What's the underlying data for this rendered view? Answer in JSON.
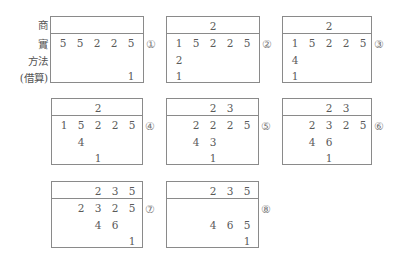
{
  "labels": {
    "quotient": "商",
    "dividend": "實",
    "divisor_method": "方法",
    "borrowed": "(借算)"
  },
  "steps": [
    {
      "marker": "①",
      "quotient": [
        "",
        "",
        "",
        "",
        ""
      ],
      "dividend": [
        "5",
        "5",
        "2",
        "2",
        "5"
      ],
      "method": [
        "",
        "",
        "",
        "",
        ""
      ],
      "borrow": [
        "",
        "",
        "",
        "",
        "1"
      ]
    },
    {
      "marker": "②",
      "quotient": [
        "",
        "",
        "2",
        "",
        ""
      ],
      "dividend": [
        "1",
        "5",
        "2",
        "2",
        "5"
      ],
      "method": [
        "2",
        "",
        "",
        "",
        ""
      ],
      "borrow": [
        "1",
        "",
        "",
        "",
        ""
      ]
    },
    {
      "marker": "③",
      "quotient": [
        "",
        "",
        "2",
        "",
        ""
      ],
      "dividend": [
        "1",
        "5",
        "2",
        "2",
        "5"
      ],
      "method": [
        "4",
        "",
        "",
        "",
        ""
      ],
      "borrow": [
        "1",
        "",
        "",
        "",
        ""
      ]
    },
    {
      "marker": "④",
      "quotient": [
        "",
        "",
        "2",
        "",
        ""
      ],
      "dividend": [
        "1",
        "5",
        "2",
        "2",
        "5"
      ],
      "method": [
        "",
        "4",
        "",
        "",
        ""
      ],
      "borrow": [
        "",
        "",
        "1",
        "",
        ""
      ]
    },
    {
      "marker": "⑤",
      "quotient": [
        "",
        "",
        "2",
        "3",
        ""
      ],
      "dividend": [
        "",
        "2",
        "2",
        "2",
        "5"
      ],
      "method": [
        "",
        "4",
        "3",
        "",
        ""
      ],
      "borrow": [
        "",
        "",
        "1",
        "",
        ""
      ]
    },
    {
      "marker": "⑥",
      "quotient": [
        "",
        "",
        "2",
        "3",
        ""
      ],
      "dividend": [
        "",
        "2",
        "3",
        "2",
        "5"
      ],
      "method": [
        "",
        "4",
        "6",
        "",
        ""
      ],
      "borrow": [
        "",
        "",
        "1",
        "",
        ""
      ]
    },
    {
      "marker": "⑦",
      "quotient": [
        "",
        "",
        "2",
        "3",
        "5"
      ],
      "dividend": [
        "",
        "2",
        "3",
        "2",
        "5"
      ],
      "method": [
        "",
        "",
        "4",
        "6",
        ""
      ],
      "borrow": [
        "",
        "",
        "",
        "",
        "1"
      ]
    },
    {
      "marker": "⑧",
      "quotient": [
        "",
        "",
        "2",
        "3",
        "5"
      ],
      "dividend": [
        "",
        "",
        "",
        "",
        ""
      ],
      "method": [
        "",
        "",
        "4",
        "6",
        "5"
      ],
      "borrow": [
        "",
        "",
        "",
        "",
        "1"
      ]
    }
  ]
}
